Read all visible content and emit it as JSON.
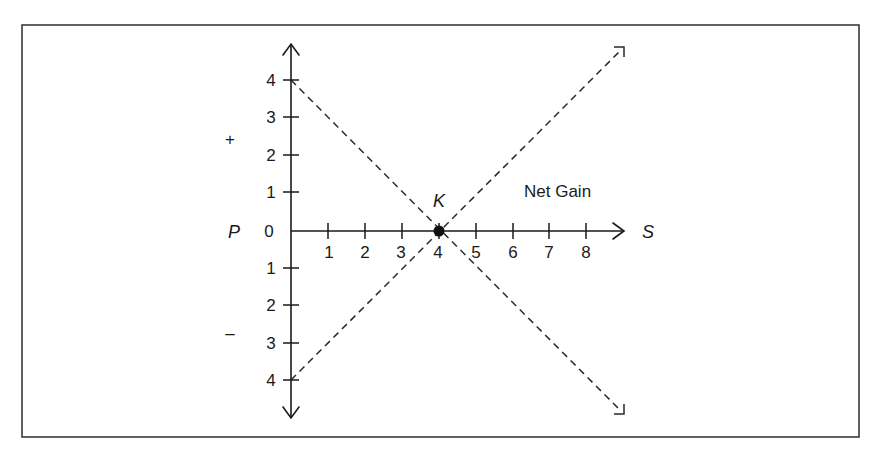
{
  "diagram": {
    "frame": {
      "x": 22,
      "y": 25,
      "width": 837,
      "height": 412,
      "stroke": "#3a3a3a"
    },
    "axes": {
      "vertical": {
        "label": "P",
        "positive_sign": "+",
        "negative_sign": "–",
        "upper_ticks": [
          "4",
          "3",
          "2",
          "1"
        ],
        "origin_tick": "0",
        "lower_ticks": [
          "1",
          "2",
          "3",
          "4"
        ]
      },
      "horizontal": {
        "label": "S",
        "ticks": [
          "1",
          "2",
          "3",
          "4",
          "5",
          "6",
          "7",
          "8"
        ]
      }
    },
    "point": {
      "label": "K",
      "s": 4,
      "p": 0
    },
    "region_label": "Net Gain",
    "lines": [
      {
        "name": "descending-dashed-line",
        "from": {
          "s": 0,
          "p": 4
        },
        "to": {
          "s": 9,
          "p": -5
        },
        "style": "dashed"
      },
      {
        "name": "ascending-dashed-line",
        "from": {
          "s": 0,
          "p": -4
        },
        "to": {
          "s": 9,
          "p": 5
        },
        "style": "dashed"
      }
    ],
    "colors": {
      "ink": "#1a1a1a",
      "background": "#ffffff"
    }
  }
}
